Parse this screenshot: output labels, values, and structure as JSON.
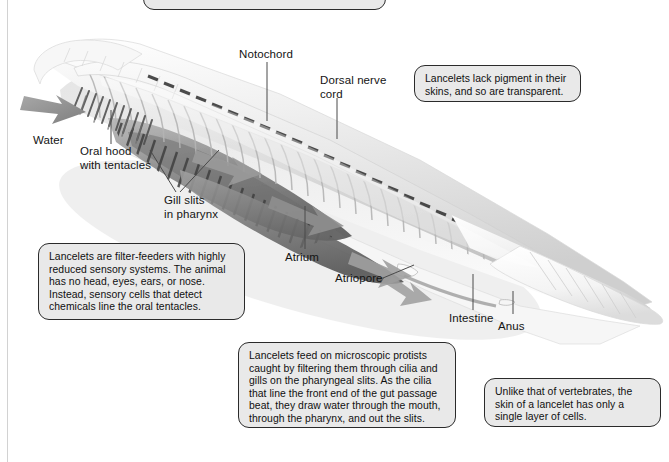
{
  "figure": {
    "background_color": "#ffffff",
    "callout_fill": "#e9e9e9",
    "callout_border": "#2b2b2b",
    "label_color": "#141414",
    "leader_color": "#4a4a4a",
    "body_light": "#f2f2f2",
    "body_mid": "#c9c9c9",
    "body_dark": "#7d7d7d",
    "body_darkest": "#4f4f4f",
    "arrow_color": "#8e8e8e"
  },
  "labels": [
    {
      "id": "notochord",
      "text": "Notochord"
    },
    {
      "id": "dorsal-nerve-cord",
      "text": "Dorsal nerve\ncord"
    },
    {
      "id": "water",
      "text": "Water"
    },
    {
      "id": "oral-hood",
      "text": "Oral hood\nwith tentacles"
    },
    {
      "id": "gill-slits",
      "text": "Gill slits\nin pharynx"
    },
    {
      "id": "atrium",
      "text": "Atrium"
    },
    {
      "id": "atriopore",
      "text": "Atriopore"
    },
    {
      "id": "intestine",
      "text": "Intestine"
    },
    {
      "id": "anus",
      "text": "Anus"
    }
  ],
  "callouts": [
    {
      "id": "pigment",
      "text": "Lancelets lack pigment in their skins, and so are transparent."
    },
    {
      "id": "filter-feeders",
      "text": "Lancelets are filter-feeders with highly reduced sensory systems. The animal has no head, eyes, ears, or nose. Instead, sensory cells that detect chemicals line the oral tentacles."
    },
    {
      "id": "feeding",
      "text": "Lancelets feed on microscopic protists caught by filtering them through cilia and gills on the pharyngeal slits. As the cilia that line the front end of the gut passage beat, they draw water through the mouth, through the pharynx, and out the slits."
    },
    {
      "id": "skin-layer",
      "text": "Unlike that of vertebrates, the skin of a lancelet has only a single layer of cells."
    },
    {
      "id": "top-cropped",
      "text": ""
    }
  ]
}
